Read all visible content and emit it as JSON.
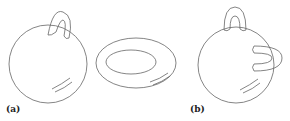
{
  "figure": {
    "panels": [
      {
        "label": "(a)",
        "description": "sphere with one handle"
      },
      {
        "label": "",
        "description": "torus"
      },
      {
        "label": "(b)",
        "description": "sphere with two handles"
      }
    ],
    "stroke_color": "#555555"
  }
}
